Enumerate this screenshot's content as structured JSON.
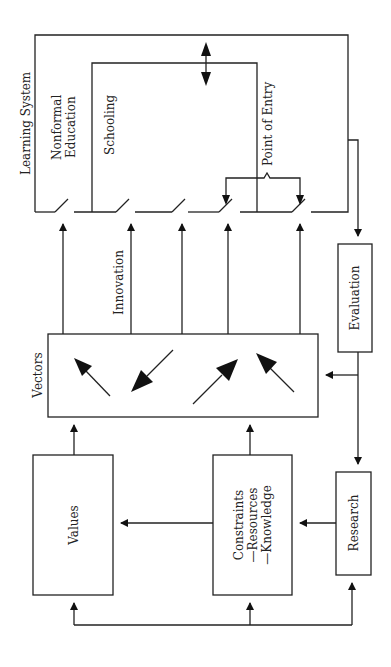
{
  "diagram": {
    "orientation": "rotated-90-ccw",
    "labels": {
      "learning_system": "Learning System",
      "nonformal_1": "Nonformal",
      "nonformal_2": "Education",
      "schooling": "Schooling",
      "point_of_entry": "Point of Entry",
      "innovation": "Innovation",
      "vectors": "Vectors",
      "evaluation": "Evaluation",
      "values": "Values",
      "constraints": "Constraints",
      "resources": "—Resources",
      "knowledge": "—Knowledge",
      "research": "Research"
    },
    "nodes": [
      {
        "id": "learning-system",
        "label": "Learning System"
      },
      {
        "id": "nonformal-education",
        "label": "Nonformal Education"
      },
      {
        "id": "schooling",
        "label": "Schooling"
      },
      {
        "id": "vectors",
        "label": "Vectors"
      },
      {
        "id": "evaluation",
        "label": "Evaluation"
      },
      {
        "id": "values",
        "label": "Values"
      },
      {
        "id": "constraints",
        "label": "Constraints —Resources —Knowledge"
      },
      {
        "id": "research",
        "label": "Research"
      }
    ],
    "edges": [
      {
        "from": "vectors",
        "to": "learning-system",
        "label": "Innovation",
        "count": 5
      },
      {
        "from": "learning-system",
        "to": "evaluation"
      },
      {
        "from": "evaluation",
        "to": "vectors"
      },
      {
        "from": "evaluation",
        "to": "research"
      },
      {
        "from": "research",
        "to": "constraints"
      },
      {
        "from": "constraints",
        "to": "values"
      },
      {
        "from": "values",
        "to": "vectors"
      },
      {
        "from": "constraints",
        "to": "vectors"
      },
      {
        "from": "feedback-bus",
        "to": "values"
      },
      {
        "from": "feedback-bus",
        "to": "constraints"
      },
      {
        "from": "feedback-bus",
        "to": "research"
      },
      {
        "from": "schooling",
        "to": "nonformal-education",
        "bidirectional": true
      }
    ]
  }
}
